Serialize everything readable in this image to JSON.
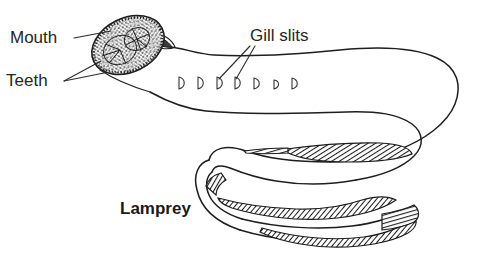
{
  "figure": {
    "background_color": "#ffffff",
    "ink_color": "#1e1e1e",
    "subject_label": "Lamprey"
  },
  "labels": {
    "mouth": "Mouth",
    "teeth": "Teeth",
    "gill_slits": "Gill slits",
    "species": "Lamprey"
  },
  "label_positions": {
    "mouth": {
      "x": 10,
      "y": 43
    },
    "teeth": {
      "x": 6,
      "y": 86
    },
    "gill_slits": {
      "x": 250,
      "y": 41
    },
    "species": {
      "x": 120,
      "y": 214
    }
  },
  "gill_slits": {
    "count": 7,
    "glyph_shape": "D",
    "positions": [
      {
        "x": 180,
        "y": 83
      },
      {
        "x": 199,
        "y": 83
      },
      {
        "x": 218,
        "y": 83
      },
      {
        "x": 236,
        "y": 83
      },
      {
        "x": 255,
        "y": 83
      },
      {
        "x": 274,
        "y": 84
      },
      {
        "x": 293,
        "y": 83
      }
    ]
  },
  "leader_lines": {
    "mouth": [
      {
        "x1": 74,
        "y1": 38,
        "x2": 110,
        "y2": 32
      }
    ],
    "teeth": [
      {
        "x1": 64,
        "y1": 80,
        "x2": 100,
        "y2": 62
      },
      {
        "x1": 64,
        "y1": 81,
        "x2": 104,
        "y2": 72
      }
    ],
    "gill_slits": [
      {
        "x1": 250,
        "y1": 45,
        "x2": 219,
        "y2": 80
      },
      {
        "x1": 254,
        "y1": 45,
        "x2": 236,
        "y2": 80
      }
    ]
  },
  "anatomy_parts": [
    "oral disc (mouth)",
    "teeth",
    "seven gill slits",
    "elongated eel-like body",
    "dorsal fin (shaded)",
    "caudal fin / tail tip (shaded)"
  ]
}
